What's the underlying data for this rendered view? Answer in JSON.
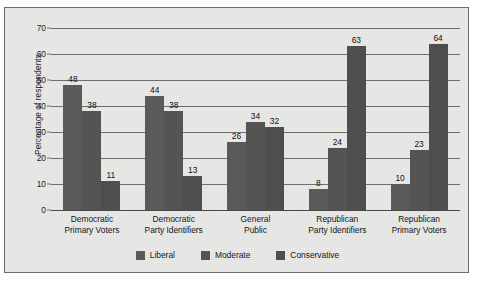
{
  "chart_data": {
    "type": "bar",
    "title": "",
    "xlabel": "",
    "ylabel": "Percentage of respondents",
    "ylim": [
      0,
      70
    ],
    "yticks": [
      0,
      10,
      20,
      30,
      40,
      50,
      60,
      70
    ],
    "grid": true,
    "legend_position": "bottom",
    "categories": [
      "Democratic Primary Voters",
      "Democratic Party Identifiers",
      "General Public",
      "Republican Party Identifiers",
      "Republican Primary Voters"
    ],
    "category_lines": [
      [
        "Democratic",
        "Primary Voters"
      ],
      [
        "Democratic",
        "Party Identifiers"
      ],
      [
        "General",
        "Public"
      ],
      [
        "Republican",
        "Party Identifiers"
      ],
      [
        "Republican",
        "Primary Voters"
      ]
    ],
    "series": [
      {
        "name": "Liberal",
        "color": "#5a5a5a",
        "values": [
          48,
          44,
          26,
          8,
          10
        ]
      },
      {
        "name": "Moderate",
        "color": "#545454",
        "values": [
          38,
          38,
          34,
          24,
          23
        ]
      },
      {
        "name": "Conservative",
        "color": "#4e4e4e",
        "values": [
          11,
          13,
          32,
          63,
          64
        ]
      }
    ]
  },
  "axis": {
    "y_title": "Percentage of respondents",
    "tick_labels": [
      "70",
      "60",
      "50",
      "40",
      "30",
      "20",
      "10",
      "0"
    ]
  },
  "legend": {
    "items": [
      {
        "label": "Liberal",
        "swatch": "#5a5a5a"
      },
      {
        "label": "Moderate",
        "swatch": "#545454"
      },
      {
        "label": "Conservative",
        "swatch": "#4e4e4e"
      }
    ]
  },
  "colors": {
    "panel_background": "#e9e9e7",
    "panel_border": "#6d6d6d",
    "gridline": "#6f6f6f",
    "text": "#151515"
  }
}
